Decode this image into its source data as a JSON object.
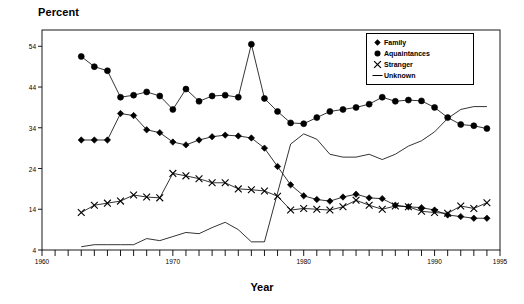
{
  "chart_data": {
    "type": "line",
    "title": "",
    "ylabel": "Percent",
    "xlabel": "Year",
    "xlim": [
      1960,
      1995
    ],
    "ylim": [
      4,
      58
    ],
    "yticks": [
      4,
      14,
      24,
      34,
      44,
      54
    ],
    "xticks": [
      1960,
      1961,
      1962,
      1963,
      1964,
      1965,
      1966,
      1967,
      1968,
      1969,
      1970,
      1971,
      1972,
      1973,
      1974,
      1975,
      1976,
      1977,
      1978,
      1979,
      1980,
      1981,
      1982,
      1983,
      1984,
      1985,
      1986,
      1987,
      1988,
      1989,
      1990,
      1991,
      1992,
      1993,
      1994,
      1995
    ],
    "xtick_labels": [
      {
        "value": 1960,
        "label": "1960"
      },
      {
        "value": 1970,
        "label": "1970"
      },
      {
        "value": 1980,
        "label": "1980"
      },
      {
        "value": 1990,
        "label": "1990"
      },
      {
        "value": 1995,
        "label": "1995"
      }
    ],
    "grid": false,
    "legend_position": "top-right",
    "x": [
      1963,
      1964,
      1965,
      1966,
      1967,
      1968,
      1969,
      1970,
      1971,
      1972,
      1973,
      1974,
      1975,
      1976,
      1977,
      1978,
      1979,
      1980,
      1981,
      1982,
      1983,
      1984,
      1985,
      1986,
      1987,
      1988,
      1989,
      1990,
      1991,
      1992,
      1993,
      1994
    ],
    "series": [
      {
        "name": "Family",
        "marker": "diamond",
        "values": [
          31.0,
          31.0,
          31.0,
          37.5,
          37.0,
          33.5,
          32.8,
          30.5,
          29.8,
          31.0,
          31.8,
          32.2,
          32.0,
          31.5,
          29.0,
          24.5,
          20.0,
          17.3,
          16.4,
          16.0,
          17.0,
          17.7,
          16.8,
          16.6,
          15.0,
          14.6,
          14.4,
          13.8,
          12.6,
          12.2,
          11.8,
          11.8
        ]
      },
      {
        "name": "Aquaintances",
        "marker": "circle",
        "values": [
          51.5,
          49.0,
          48.0,
          41.5,
          42.0,
          42.8,
          41.8,
          38.5,
          43.5,
          40.5,
          41.8,
          42.0,
          41.5,
          54.5,
          41.2,
          38.0,
          35.2,
          35.0,
          36.5,
          38.0,
          38.5,
          39.0,
          39.8,
          41.5,
          40.5,
          40.8,
          40.6,
          39.0,
          36.5,
          34.8,
          34.5,
          33.8
        ]
      },
      {
        "name": "Stranger",
        "marker": "x",
        "values": [
          13.2,
          15.0,
          15.5,
          16.0,
          17.5,
          17.0,
          16.8,
          22.8,
          22.2,
          21.5,
          20.5,
          20.5,
          19.0,
          18.8,
          18.5,
          17.2,
          13.8,
          14.2,
          14.0,
          13.8,
          14.6,
          16.2,
          15.0,
          14.0,
          14.8,
          14.6,
          13.5,
          13.2,
          13.0,
          14.8,
          14.2,
          15.6
        ]
      },
      {
        "name": "Unknown",
        "marker": "line",
        "values": [
          4.8,
          5.3,
          5.3,
          5.3,
          5.3,
          6.8,
          6.3,
          7.3,
          8.3,
          8.0,
          9.5,
          10.8,
          9.0,
          6.0,
          6.0,
          18.0,
          30.0,
          32.5,
          31.2,
          27.5,
          26.8,
          26.8,
          27.5,
          26.2,
          27.5,
          29.5,
          30.8,
          33.0,
          36.3,
          38.5,
          39.2,
          39.2
        ]
      }
    ]
  },
  "legend": {
    "items": [
      {
        "label": "Family",
        "symbol": "diamond"
      },
      {
        "label": "Aquaintances",
        "symbol": "circle"
      },
      {
        "label": "Stranger",
        "symbol": "x"
      },
      {
        "label": "Unknown",
        "symbol": "line"
      }
    ]
  }
}
